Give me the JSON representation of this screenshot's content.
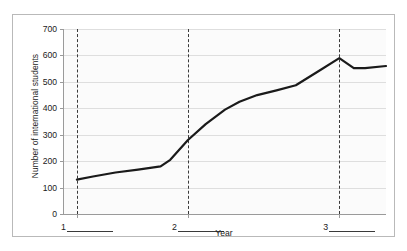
{
  "chart_data": {
    "type": "line",
    "title": "",
    "xlabel": "Year",
    "ylabel": "Number of international students",
    "ylim": [
      0,
      700
    ],
    "yticks": [
      0,
      100,
      200,
      300,
      400,
      500,
      600,
      700
    ],
    "ytick_labels": [
      "0",
      "100",
      "200",
      "300",
      "400",
      "500",
      "600",
      "700"
    ],
    "grid": true,
    "legend": "none",
    "x_category_labels": [
      "1",
      "2",
      "3"
    ],
    "x_category_has_blank_line": true,
    "annotations": [
      {
        "name": "vertical-dashed-line-1",
        "x": 0.04,
        "style": "dashed"
      },
      {
        "name": "vertical-dashed-line-2",
        "x": 0.385,
        "style": "dashed"
      },
      {
        "name": "vertical-dashed-line-3",
        "x": 0.855,
        "style": "dashed"
      }
    ],
    "series": [
      {
        "name": "international students",
        "color": "#1a1a1a",
        "x": [
          0.04,
          0.09,
          0.16,
          0.23,
          0.3,
          0.33,
          0.385,
          0.44,
          0.5,
          0.545,
          0.6,
          0.66,
          0.72,
          0.79,
          0.855,
          0.9,
          0.935,
          1.0
        ],
        "values": [
          130,
          142,
          157,
          168,
          180,
          205,
          280,
          340,
          395,
          425,
          450,
          468,
          487,
          540,
          590,
          552,
          552,
          560
        ]
      }
    ],
    "line_width_px": 2.2
  },
  "figure": {
    "border_color": "#b9b9b9",
    "plot_background": "#fbfbfb",
    "gridline_color": "#dedede",
    "axis_color": "#9a9a9a",
    "dash_color": "#3a3a3a",
    "text_color": "#1a1a1a"
  }
}
